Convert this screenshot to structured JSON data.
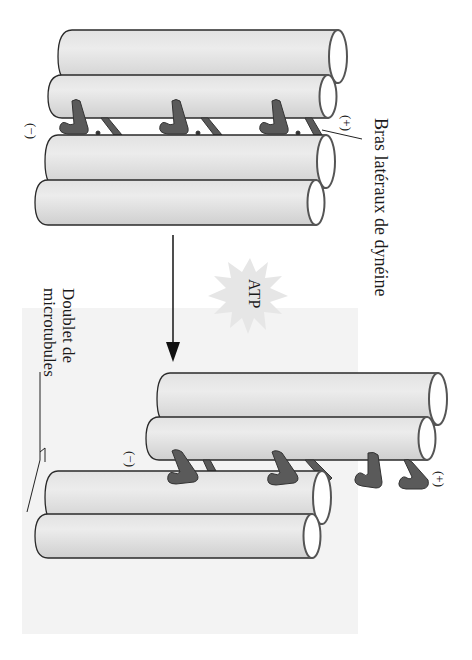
{
  "figure": {
    "labels": {
      "dynein_arms": "Bras latéraux de dynéine",
      "doublet_line1": "Doublet de",
      "doublet_line2": "microtubules",
      "atp": "ATP"
    },
    "polarity": {
      "top_minus": "(−)",
      "top_plus": "(+)",
      "bottom_minus": "(−)",
      "bottom_plus": "(+)"
    },
    "colors": {
      "tube_fill": "#dcdcdc",
      "tube_highlight": "#eeeeee",
      "tube_outline": "#2a2a2a",
      "dynein_arm": "#5a5a5a",
      "atp_burst": "#e6e6e6",
      "shaded_panel": "#f3f3f3",
      "text": "#1a1a1a"
    },
    "panels": [
      {
        "name": "before-sliding",
        "upper_doublet_tubes": 2,
        "lower_doublet_tubes": 2,
        "dynein_arm_count": 3,
        "state": "aligned"
      },
      {
        "name": "after-sliding",
        "upper_doublet_tubes": 2,
        "lower_doublet_tubes": 2,
        "dynein_arm_count": 4,
        "state": "upper doublet displaced toward (+) end"
      }
    ],
    "arrow": "down"
  }
}
